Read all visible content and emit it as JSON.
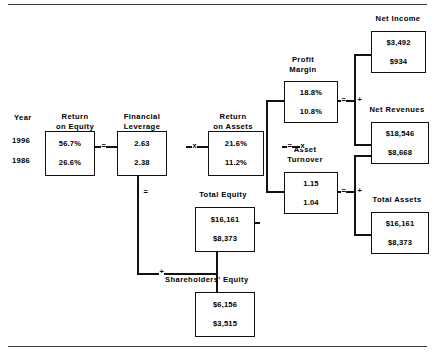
{
  "diagram": {
    "year_header": "Year",
    "years": [
      "1996",
      "1986"
    ],
    "nodes": {
      "return_on_equity": {
        "label_line1": "Return",
        "label_line2": "on  Equity",
        "values": [
          "56.7%",
          "26.6%"
        ]
      },
      "financial_leverage": {
        "label_line1": "Financial",
        "label_line2": "Leverage",
        "values": [
          "2.63",
          "2.38"
        ]
      },
      "return_on_assets": {
        "label_line1": "Return",
        "label_line2": "on  Assets",
        "values": [
          "21.6%",
          "11.2%"
        ]
      },
      "profit_margin": {
        "label_line1": "Profit",
        "label_line2": "Margin",
        "values": [
          "18.8%",
          "10.8%"
        ]
      },
      "asset_turnover": {
        "label_line1": "Asset",
        "label_line2": "Turnover",
        "values": [
          "1.15",
          "1.04"
        ]
      },
      "net_income": {
        "label_line1": "Net  Income",
        "label_line2": "",
        "values": [
          "$3,492",
          "$934"
        ]
      },
      "net_revenues": {
        "label_line1": "Net  Revenues",
        "label_line2": "",
        "values": [
          "$18,546",
          "$8,668"
        ]
      },
      "total_assets": {
        "label_line1": "Total  Assets",
        "label_line2": "",
        "values": [
          "$16,161",
          "$8,373"
        ]
      },
      "total_equity": {
        "label_line1": "Total  Equity",
        "label_line2": "",
        "values": [
          "$16,161",
          "$8,373"
        ]
      },
      "shareholders_equity": {
        "label_line1": "Shareholders'  Equity",
        "label_line2": "",
        "values": [
          "$6,156",
          "$3,515"
        ]
      }
    },
    "operators": {
      "roe_equals": "=",
      "leverage_times": "x",
      "roa_equals": "=",
      "roa_times": "x",
      "leverage_equals": "=",
      "equity_plus": "+",
      "pm_equals": "=",
      "pm_plus": "+",
      "at_equals": "=",
      "at_plus": "+"
    },
    "colors": {
      "line": "#111111",
      "text": "#000000",
      "background": "#ffffff"
    }
  }
}
